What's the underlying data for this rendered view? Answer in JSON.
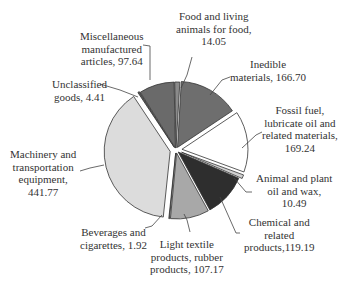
{
  "chart_data": {
    "type": "pie",
    "title": "",
    "slices": [
      {
        "label": "Food and living animals for food",
        "value": 14.05,
        "color": "#8a8a8a"
      },
      {
        "label": "Inedible materials",
        "value": 166.7,
        "color": "#6e6e6e"
      },
      {
        "label": "Fossil fuel, lubricate oil and related materials",
        "value": 169.24,
        "color": "#ffffff"
      },
      {
        "label": "Animal and plant oil and wax",
        "value": 10.49,
        "color": "#d0d0d0"
      },
      {
        "label": "Chemical and related products",
        "value": 119.19,
        "color": "#2e2e2e"
      },
      {
        "label": "Light textile products, rubber products",
        "value": 107.17,
        "color": "#a8a8a8"
      },
      {
        "label": "Beverages and cigarettes",
        "value": 1.92,
        "color": "#7a7a7a"
      },
      {
        "label": "Machinery and transportation equipment",
        "value": 441.77,
        "color": "#dcdcdc"
      },
      {
        "label": "Unclassified goods",
        "value": 4.41,
        "color": "#5a5a5a"
      },
      {
        "label": "Miscellaneous manufactured articles",
        "value": 97.64,
        "color": "#6a6a6a"
      }
    ]
  },
  "labels": {
    "food": [
      "Food and living",
      "animals for food,",
      "14.05"
    ],
    "inedible": [
      "Inedible",
      "materials, 166.70"
    ],
    "fossil": [
      "Fossil fuel,",
      "lubricate oil and",
      "related materials,",
      "169.24"
    ],
    "animal": [
      "Animal and plant",
      "oil and wax,",
      "10.49"
    ],
    "chemical": [
      "Chemical and",
      "related",
      "products,119.19"
    ],
    "light": [
      "Light textile",
      "products, rubber",
      "products, 107.17"
    ],
    "beverages": [
      "Beverages and",
      "cigarettes, 1.92"
    ],
    "machinery": [
      "Machinery and",
      "transportation",
      "equipment,",
      "441.77"
    ],
    "unclassified": [
      "Unclassified",
      "goods, 4.41"
    ],
    "misc": [
      "Miscellaneous",
      "manufactured",
      "articles, 97.64"
    ]
  }
}
